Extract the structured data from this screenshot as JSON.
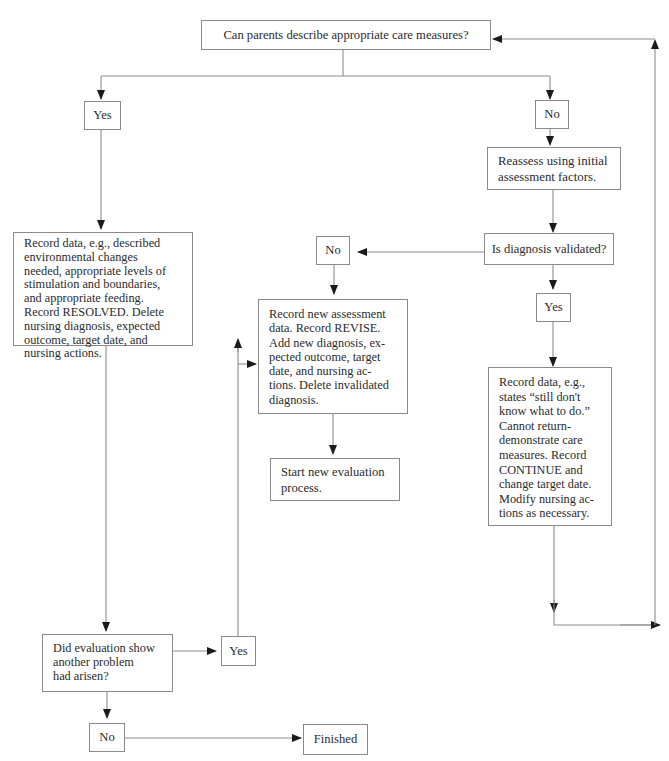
{
  "diagram": {
    "type": "flowchart",
    "colors": {
      "line": "#8c8c8c",
      "box_border": "#8a8a8a",
      "text": "#2b2b2b",
      "background": "#ffffff"
    },
    "nodes": {
      "question_parents": "Can parents describe appropriate care measures?",
      "yes_top": "Yes",
      "no_top": "No",
      "reassess": "Reassess using initial\nassessment factors.",
      "diagnosis_validated": "Is diagnosis validated?",
      "no_diag": "No",
      "yes_diag": "Yes",
      "record_resolved": "Record data, e.g., described\nenvironmental changes\nneeded, appropriate levels of\nstimulation and boundaries,\nand appropriate feeding.\nRecord RESOLVED. Delete\nnursing diagnosis, expected\noutcome, target date, and\nnursing actions.",
      "record_revise": "Record new assessment\ndata. Record REVISE.\nAdd new diagnosis, ex-\npected outcome, target\ndate, and nursing ac-\ntions. Delete invalidated\ndiagnosis.",
      "start_new": "Start new evaluation\nprocess.",
      "record_continue": "Record data, e.g.,\nstates “still don't\nknow what to do.”\nCannot return-\ndemonstrate care\nmeasures. Record\nCONTINUE and\nchange target date.\nModify nursing ac-\ntions as necessary.",
      "another_problem": "Did evaluation show\nanother problem\nhad arisen?",
      "yes_problem": "Yes",
      "no_problem": "No",
      "finished": "Finished"
    },
    "edges": [
      {
        "from": "question_parents",
        "to": "yes_top"
      },
      {
        "from": "question_parents",
        "to": "no_top"
      },
      {
        "from": "yes_top",
        "to": "record_resolved"
      },
      {
        "from": "no_top",
        "to": "reassess"
      },
      {
        "from": "reassess",
        "to": "diagnosis_validated"
      },
      {
        "from": "diagnosis_validated",
        "to": "no_diag"
      },
      {
        "from": "diagnosis_validated",
        "to": "yes_diag"
      },
      {
        "from": "no_diag",
        "to": "record_revise"
      },
      {
        "from": "record_revise",
        "to": "start_new"
      },
      {
        "from": "yes_diag",
        "to": "record_continue"
      },
      {
        "from": "record_continue",
        "to": "question_parents",
        "note": "loop back via right edge"
      },
      {
        "from": "record_resolved",
        "to": "another_problem"
      },
      {
        "from": "another_problem",
        "to": "yes_problem"
      },
      {
        "from": "yes_problem",
        "to": "record_revise"
      },
      {
        "from": "another_problem",
        "to": "no_problem"
      },
      {
        "from": "no_problem",
        "to": "finished"
      }
    ]
  }
}
